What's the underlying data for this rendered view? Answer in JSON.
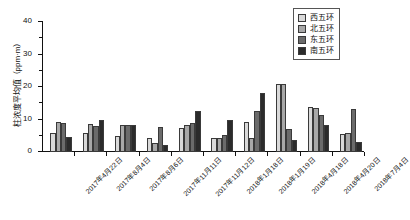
{
  "chart_data": {
    "type": "bar",
    "title": "",
    "xlabel": "",
    "ylabel": "柱浓度平均值（ppm·m）",
    "ylim": [
      0,
      40
    ],
    "yticks": [
      0,
      10,
      20,
      30,
      40
    ],
    "ytick_labels": [
      "0",
      "10",
      "20",
      "30",
      "40"
    ],
    "grid": false,
    "legend_position": "top-right",
    "categories": [
      "2017年4月22日",
      "2017年8月4日",
      "2017年8月6日",
      "2017年11月11日",
      "2017年11月12日",
      "2018年1月18日",
      "2018年1月19日",
      "2018年4月18日",
      "2018年4月20日",
      "2018年7月4日"
    ],
    "series": [
      {
        "name": "西五环",
        "color": "#d9d9d9",
        "values": [
          6.0,
          6.0,
          4.8,
          4.2,
          7.4,
          4.2,
          9.3,
          21.0,
          14.0,
          5.5
        ]
      },
      {
        "name": "北五环",
        "color": "#a8a8a8",
        "values": [
          9.3,
          8.7,
          8.2,
          2.8,
          8.3,
          4.3,
          4.4,
          21.0,
          13.5,
          5.7
        ]
      },
      {
        "name": "东五环",
        "color": "#6b6b6b",
        "values": [
          8.8,
          8.0,
          8.3,
          7.8,
          8.8,
          5.3,
          12.6,
          7.2,
          11.5,
          13.3
        ]
      },
      {
        "name": "南五环",
        "color": "#2b2b2b",
        "values": [
          4.5,
          10.0,
          8.3,
          2.2,
          12.7,
          10.0,
          18.2,
          3.8,
          8.3,
          3.2
        ]
      }
    ]
  }
}
